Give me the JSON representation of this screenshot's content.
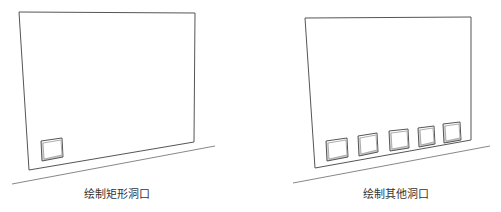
{
  "figure": {
    "panels": [
      {
        "id": "left",
        "caption": "绘制矩形洞口",
        "wall_outline": {
          "top_left": [
            19,
            12
          ],
          "top_right": [
            195,
            13
          ],
          "bottom_right": [
            194,
            142
          ],
          "bottom_left": [
            29,
            170
          ]
        },
        "ground_line": {
          "start": [
            12,
            184
          ],
          "end": [
            215,
            146
          ]
        },
        "openings": [
          {
            "outer": [
              [
                41,
                141
              ],
              [
                62,
                138
              ],
              [
                63,
                157
              ],
              [
                42,
                161
              ]
            ]
          }
        ]
      },
      {
        "id": "right",
        "caption": "绘制其他洞口",
        "wall_outline": {
          "top_left": [
            305,
            18
          ],
          "top_right": [
            471,
            17
          ],
          "bottom_right": [
            471,
            140
          ],
          "bottom_left": [
            315,
            168
          ]
        },
        "ground_line": {
          "start": [
            293,
            183
          ],
          "end": [
            490,
            146
          ]
        },
        "openings": [
          {
            "outer": [
              [
                326,
                141
              ],
              [
                347,
                138
              ],
              [
                348,
                157
              ],
              [
                327,
                161
              ]
            ]
          },
          {
            "outer": [
              [
                358,
                136
              ],
              [
                377,
                133
              ],
              [
                378,
                152
              ],
              [
                359,
                156
              ]
            ]
          },
          {
            "outer": [
              [
                389,
                131
              ],
              [
                408,
                129
              ],
              [
                409,
                148
              ],
              [
                390,
                151
              ]
            ]
          },
          {
            "outer": [
              [
                418,
                128
              ],
              [
                434,
                126
              ],
              [
                435,
                144
              ],
              [
                419,
                147
              ]
            ]
          },
          {
            "outer": [
              [
                443,
                124
              ],
              [
                460,
                122
              ],
              [
                461,
                140
              ],
              [
                444,
                143
              ]
            ]
          }
        ]
      }
    ],
    "colors": {
      "background": "#ffffff",
      "wall_line": "#555555",
      "ground_line": "#888888",
      "opening_line": "#555555",
      "opening_depth": "#999999",
      "caption_text": "#333333"
    }
  }
}
